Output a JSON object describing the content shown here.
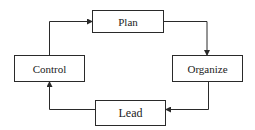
{
  "diagram": {
    "type": "cycle-flowchart",
    "nodes": [
      {
        "id": "plan",
        "label": "Plan"
      },
      {
        "id": "organize",
        "label": "Organize"
      },
      {
        "id": "lead",
        "label": "Lead"
      },
      {
        "id": "control",
        "label": "Control"
      }
    ],
    "edges": [
      {
        "from": "plan",
        "to": "organize"
      },
      {
        "from": "organize",
        "to": "lead"
      },
      {
        "from": "lead",
        "to": "control"
      },
      {
        "from": "control",
        "to": "plan"
      }
    ],
    "colors": {
      "stroke": "#2a2a2a",
      "text": "#222222",
      "background": "#ffffff"
    }
  }
}
